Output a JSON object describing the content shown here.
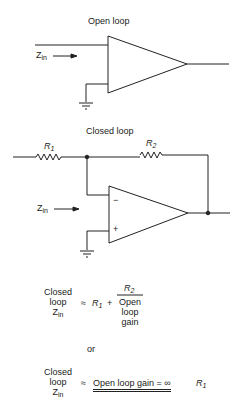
{
  "open_loop": {
    "title": "Open loop",
    "zin_label": "Z",
    "zin_sub": "in"
  },
  "closed_loop": {
    "title": "Closed loop",
    "r1_label": "R",
    "r1_sub": "1",
    "r2_label": "R",
    "r2_sub": "2",
    "zin_label": "Z",
    "zin_sub": "in",
    "minus_sign": "−",
    "plus_sign": "+"
  },
  "equation1": {
    "lhs": [
      "Closed",
      "loop",
      "Z"
    ],
    "lhs_sub": "in",
    "approx": "≈",
    "r1": "R",
    "r1_sub": "1",
    "plus": "+",
    "numerator": "R",
    "numerator_sub": "2",
    "denominator": [
      "Open",
      "loop",
      "gain"
    ]
  },
  "or_text": "or",
  "equation2": {
    "lhs": [
      "Closed",
      "loop",
      "Z"
    ],
    "lhs_sub": "in",
    "approx": "≈",
    "condition": "Open loop gain = ∞",
    "r1": "R",
    "r1_sub": "1"
  },
  "colors": {
    "line": "#222222",
    "background": "#ffffff"
  }
}
